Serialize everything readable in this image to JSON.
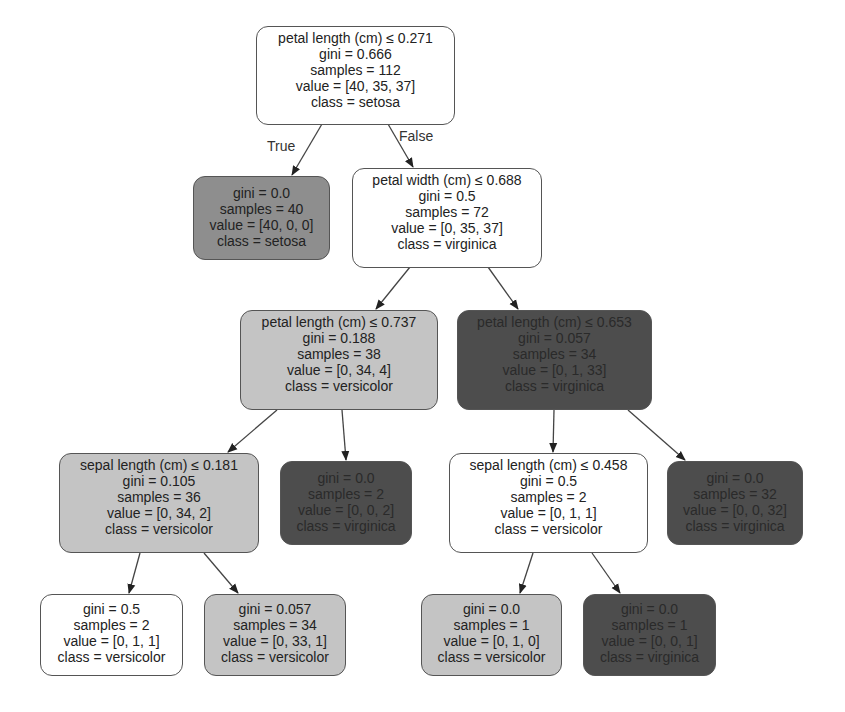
{
  "diagram": {
    "type": "decision-tree",
    "colors": {
      "white": "#ffffff",
      "light_gray": "#c4c4c4",
      "mid_gray": "#8e8e8e",
      "dark_gray": "#4d4d4d",
      "border": "#555555"
    },
    "edge_labels": {
      "true_label": "True",
      "false_label": "False"
    },
    "nodes": {
      "n0": {
        "split": "petal length (cm) ≤ 0.271",
        "gini": "gini = 0.666",
        "samples": "samples = 112",
        "value": "value = [40, 35, 37]",
        "class": "class = setosa"
      },
      "n1": {
        "gini": "gini = 0.0",
        "samples": "samples = 40",
        "value": "value = [40, 0, 0]",
        "class": "class = setosa"
      },
      "n2": {
        "split": "petal width (cm) ≤ 0.688",
        "gini": "gini = 0.5",
        "samples": "samples = 72",
        "value": "value = [0, 35, 37]",
        "class": "class = virginica"
      },
      "n3": {
        "split": "petal length (cm) ≤ 0.737",
        "gini": "gini = 0.188",
        "samples": "samples = 38",
        "value": "value = [0, 34, 4]",
        "class": "class = versicolor"
      },
      "n4": {
        "split": "petal length (cm) ≤ 0.653",
        "gini": "gini = 0.057",
        "samples": "samples = 34",
        "value": "value = [0, 1, 33]",
        "class": "class = virginica"
      },
      "n5": {
        "split": "sepal length (cm) ≤ 0.181",
        "gini": "gini = 0.105",
        "samples": "samples = 36",
        "value": "value = [0, 34, 2]",
        "class": "class = versicolor"
      },
      "n6": {
        "gini": "gini = 0.0",
        "samples": "samples = 2",
        "value": "value = [0, 0, 2]",
        "class": "class = virginica"
      },
      "n7": {
        "split": "sepal length (cm) ≤ 0.458",
        "gini": "gini = 0.5",
        "samples": "samples = 2",
        "value": "value = [0, 1, 1]",
        "class": "class = versicolor"
      },
      "n8": {
        "gini": "gini = 0.0",
        "samples": "samples = 32",
        "value": "value = [0, 0, 32]",
        "class": "class = virginica"
      },
      "n9": {
        "gini": "gini = 0.5",
        "samples": "samples = 2",
        "value": "value = [0, 1, 1]",
        "class": "class = versicolor"
      },
      "n10": {
        "gini": "gini = 0.057",
        "samples": "samples = 34",
        "value": "value = [0, 33, 1]",
        "class": "class = versicolor"
      },
      "n11": {
        "gini": "gini = 0.0",
        "samples": "samples = 1",
        "value": "value = [0, 1, 0]",
        "class": "class = versicolor"
      },
      "n12": {
        "gini": "gini = 0.0",
        "samples": "samples = 1",
        "value": "value = [0, 0, 1]",
        "class": "class = virginica"
      }
    }
  }
}
